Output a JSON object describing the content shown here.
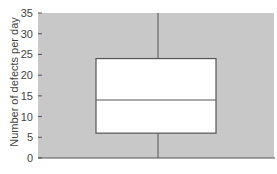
{
  "chart_data": {
    "type": "box",
    "title": "",
    "xlabel": "",
    "ylabel": "Number of defects per day",
    "ylim": [
      0,
      35
    ],
    "yticks": [
      0,
      5,
      10,
      15,
      20,
      25,
      30,
      35
    ],
    "grid": false,
    "series": [
      {
        "name": "Defects",
        "min": 0,
        "q1": 6,
        "median": 14,
        "q3": 24,
        "max": 35
      }
    ]
  },
  "colors": {
    "plot_bg": "#c8c8c8",
    "box_fill": "#ffffff",
    "line": "#555555"
  }
}
